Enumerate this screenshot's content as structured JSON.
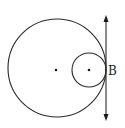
{
  "diagram": {
    "type": "geometry",
    "colors": {
      "stroke": "#2a2a2a",
      "background": "#ffffff"
    },
    "large_circle": {
      "cx": 57,
      "cy": 68,
      "r": 49
    },
    "small_circle": {
      "cx": 89,
      "cy": 70,
      "r": 17
    },
    "large_center_dot": {
      "cx": 56,
      "cy": 70
    },
    "small_center_dot": {
      "cx": 89,
      "cy": 70
    },
    "tangent_line": {
      "x": 106,
      "y1": 16,
      "y2": 121,
      "arrows": "both"
    },
    "point_label": {
      "text": "B",
      "x": 108,
      "y": 75
    }
  }
}
